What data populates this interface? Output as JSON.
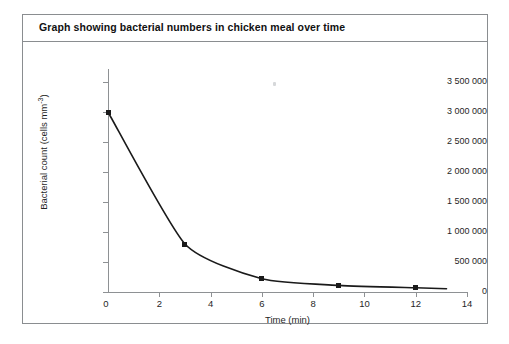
{
  "figure": {
    "title": "Graph showing bacterial numbers in chicken meal over time"
  },
  "chart_data": {
    "type": "line",
    "title": "Graph showing bacterial numbers in chicken meal over time",
    "xlabel": "Time (min)",
    "ylabel": "Bacterial count (cells mm-3)",
    "ylabel_base": "Bacterial count (cells mm",
    "ylabel_exponent": "-3",
    "ylabel_suffix": ")",
    "xlim": [
      0,
      14
    ],
    "ylim": [
      0,
      3500000
    ],
    "grid": false,
    "legend": false,
    "marker": "filled-diamond",
    "line_color": "#1a1a1a",
    "x": [
      0,
      3,
      6,
      9,
      12
    ],
    "values": [
      3000000,
      800000,
      220000,
      110000,
      70000
    ],
    "xticks": [
      0,
      2,
      4,
      6,
      8,
      10,
      12,
      14
    ],
    "xtick_labels": [
      "0",
      "2",
      "4",
      "6",
      "8",
      "10",
      "12",
      "14"
    ],
    "yticks": [
      0,
      500000,
      1000000,
      1500000,
      2000000,
      2500000,
      3000000,
      3500000
    ],
    "ytick_labels": [
      "0",
      "500 000",
      "1 000 000",
      "1 500 000",
      "2 000 000",
      "2 500 000",
      "3 000 000",
      "3 500 000"
    ]
  }
}
